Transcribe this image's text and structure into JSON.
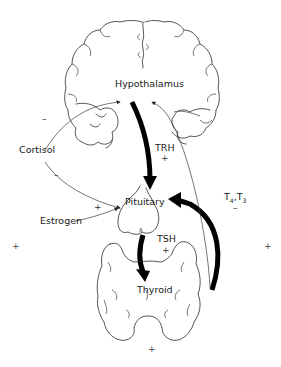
{
  "diagram": {
    "type": "hypothalamic-pituitary-thyroid axis",
    "nodes": {
      "hypothalamus": "Hypothalamus",
      "pituitary": "Pituitary",
      "thyroid": "Thyroid"
    },
    "hormones": {
      "trh": "TRH",
      "tsh": "TSH",
      "t4t3": "T4, T3",
      "t4_sub": "4",
      "t3_sub": "3",
      "t_letter": "T"
    },
    "modulators": {
      "cortisol": "Cortisol",
      "estrogen": "Estrogen"
    },
    "signs": {
      "plus": "+",
      "minus": "–"
    },
    "edges": [
      {
        "from": "Hypothalamus",
        "to": "Pituitary",
        "label": "TRH",
        "sign": "+",
        "style": "thick"
      },
      {
        "from": "Pituitary",
        "to": "Thyroid",
        "label": "TSH",
        "sign": "+",
        "style": "thick"
      },
      {
        "from": "Thyroid",
        "to": "Pituitary",
        "label": "T4, T3",
        "sign": "–",
        "style": "thick"
      },
      {
        "from": "Thyroid",
        "to": "Hypothalamus",
        "label": "T4, T3",
        "sign": "–",
        "style": "thin"
      },
      {
        "from": "Cortisol",
        "to": "Hypothalamus",
        "sign": "–",
        "style": "thin"
      },
      {
        "from": "Cortisol",
        "to": "Pituitary",
        "sign": "–",
        "style": "thin"
      },
      {
        "from": "Estrogen",
        "to": "Pituitary",
        "sign": "+",
        "style": "thin"
      }
    ],
    "colors": {
      "stroke": "#000000",
      "background": "#ffffff"
    }
  }
}
